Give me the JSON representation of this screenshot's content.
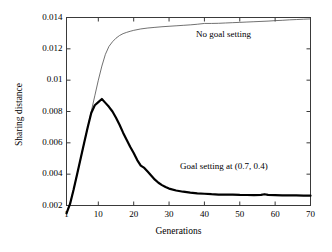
{
  "chart_data": {
    "type": "line",
    "title": "",
    "xlabel": "Generations",
    "ylabel": "Sharing distance",
    "xlim": [
      1,
      70
    ],
    "ylim": [
      0.002,
      0.014
    ],
    "xticks": [
      "1",
      "10",
      "20",
      "30",
      "40",
      "50",
      "60",
      "70"
    ],
    "xtick_values": [
      1,
      10,
      20,
      30,
      40,
      50,
      60,
      70
    ],
    "yticks": [
      "0.002",
      "0.004",
      "0.006",
      "0.008",
      "0.01",
      "0.012",
      "0.014"
    ],
    "ytick_values": [
      0.002,
      0.004,
      0.006,
      0.008,
      0.01,
      0.012,
      0.014
    ],
    "grid": false,
    "legend_position": "inline-annotations",
    "series": [
      {
        "name": "No goal setting",
        "style": "thin",
        "color": "#4d4d4d",
        "linewidth": 0.8,
        "annotation": "No goal setting",
        "x": [
          1,
          2,
          3,
          4,
          5,
          6,
          7,
          8,
          9,
          10,
          11,
          12,
          13,
          14,
          15,
          16,
          17,
          18,
          19,
          20,
          22,
          24,
          26,
          28,
          30,
          32,
          34,
          36,
          38,
          40,
          42,
          44,
          46,
          48,
          50,
          52,
          54,
          56,
          58,
          60,
          62,
          64,
          66,
          68,
          70
        ],
        "values": [
          0.0015,
          0.00215,
          0.003,
          0.004,
          0.005,
          0.006,
          0.007,
          0.008,
          0.009,
          0.01,
          0.0109,
          0.01165,
          0.01215,
          0.01245,
          0.01268,
          0.01285,
          0.01297,
          0.01305,
          0.01312,
          0.01318,
          0.01327,
          0.01333,
          0.01337,
          0.01341,
          0.01344,
          0.01347,
          0.0135,
          0.01353,
          0.01357,
          0.01362,
          0.01362,
          0.01363,
          0.01365,
          0.01367,
          0.01369,
          0.01371,
          0.01373,
          0.01375,
          0.01377,
          0.0138,
          0.01382,
          0.01385,
          0.01387,
          0.01389,
          0.01391
        ]
      },
      {
        "name": "Goal setting at (0.7, 0.4)",
        "style": "thick",
        "color": "#000000",
        "linewidth": 2.2,
        "annotation": "Goal setting at (0.7, 0.4)",
        "x": [
          1,
          2,
          3,
          4,
          5,
          6,
          7,
          8,
          9,
          10,
          11,
          12,
          13,
          14,
          15,
          16,
          17,
          18,
          19,
          20,
          21,
          22,
          23,
          24,
          25,
          26,
          27,
          28,
          29,
          30,
          32,
          34,
          36,
          38,
          40,
          42,
          44,
          46,
          48,
          50,
          52,
          54,
          56,
          57,
          58,
          60,
          62,
          64,
          66,
          68,
          70
        ],
        "values": [
          0.0015,
          0.0021,
          0.003,
          0.004,
          0.005,
          0.006,
          0.007,
          0.0079,
          0.0084,
          0.0086,
          0.0088,
          0.00855,
          0.0083,
          0.008,
          0.0076,
          0.00715,
          0.00665,
          0.0062,
          0.00575,
          0.00535,
          0.0049,
          0.00455,
          0.0044,
          0.00415,
          0.0039,
          0.00365,
          0.00345,
          0.0033,
          0.00318,
          0.00308,
          0.00296,
          0.00288,
          0.00282,
          0.00278,
          0.00275,
          0.00272,
          0.0027,
          0.00269,
          0.0027,
          0.00268,
          0.00267,
          0.00266,
          0.00268,
          0.00272,
          0.00268,
          0.00266,
          0.00265,
          0.00264,
          0.00264,
          0.00263,
          0.00263
        ]
      }
    ]
  },
  "annotations": {
    "no_goal": "No goal setting",
    "goal": "Goal setting at (0.7, 0.4)"
  },
  "axes": {
    "x_title": "Generations",
    "y_title": "Sharing distance"
  }
}
